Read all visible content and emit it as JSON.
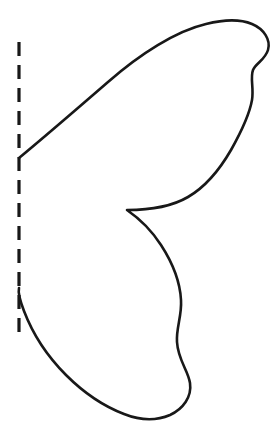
{
  "page": {
    "background_color": "#ffffff",
    "width": 280,
    "height": 433
  },
  "drawing": {
    "ink_color": "#181818",
    "outline_stroke_width": 2.6,
    "fold_stroke_width": 3.2,
    "fold_line": {
      "name": "fold-line",
      "orientation": "vertical",
      "x": 19,
      "y_start": 42,
      "y_end": 340,
      "dash_length": 14,
      "gap_length": 9,
      "dash_array": "14 9"
    },
    "outline": {
      "name": "wing-outline",
      "closed": false,
      "start_point": [
        19,
        158
      ],
      "end_point": [
        19,
        288
      ],
      "cusp_point": [
        127,
        210
      ],
      "apex_point": [
        232,
        21
      ],
      "rightmost_point": [
        270,
        32
      ],
      "bottom_point": [
        145,
        418
      ],
      "path": "M 19,158 C 48,134 78,108 108,82 C 140,54 176,31 206,24 C 222,20 240,19 252,24 C 264,29 271,40 268,50 C 265,60 256,63 253,70 C 250,78 254,88 252,100 C 249,117 240,134 231,150 C 220,169 207,186 188,197 C 171,207 148,210 127,210 C 140,219 152,231 161,245 C 172,262 180,280 181,300 C 182,316 176,328 177,342 C 178,360 188,370 190,383 C 192,397 183,409 170,415 C 156,421 139,420 124,414 C 103,406 83,392 66,375 C 47,356 32,332 24,311 C 19,298 18,292 19,288"
    }
  }
}
